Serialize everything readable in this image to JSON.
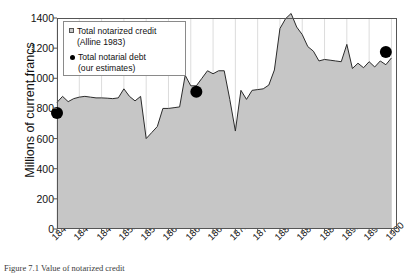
{
  "figure": {
    "caption": "Figure 7.1  Value of notarized credit"
  },
  "legend": {
    "items": [
      {
        "marker": "square-swatch",
        "line1": "Total notarized credit",
        "line2": "(Alline 1983)"
      },
      {
        "marker": "dot-swatch",
        "line1": "Total notarial debt",
        "line2": "(our estimates)"
      }
    ]
  },
  "chart_data": {
    "type": "area",
    "title": "",
    "xlabel": "",
    "ylabel": "Millions of current francs",
    "xlim": [
      1840,
      1901
    ],
    "ylim": [
      0,
      1400
    ],
    "yticks": [
      0,
      200,
      400,
      600,
      800,
      1000,
      1200,
      1400
    ],
    "xticks": [
      1840,
      1844,
      1848,
      1852,
      1856,
      1860,
      1864,
      1868,
      1872,
      1876,
      1880,
      1884,
      1888,
      1892,
      1896,
      1900
    ],
    "grid": true,
    "colors": {
      "area_fill": "#c6c6c6",
      "area_line": "#2b2b2b",
      "marker": "#000000",
      "axis": "#555555",
      "grid": "#dcdcdc"
    },
    "series": [
      {
        "name": "Total notarized credit (Alline 1983)",
        "type": "area",
        "x": [
          1840,
          1841,
          1842,
          1843,
          1844,
          1845,
          1846,
          1847,
          1848,
          1849,
          1850,
          1851,
          1852,
          1853,
          1854,
          1855,
          1856,
          1857,
          1858,
          1859,
          1860,
          1861,
          1862,
          1863,
          1864,
          1865,
          1866,
          1867,
          1868,
          1869,
          1870,
          1871,
          1872,
          1873,
          1874,
          1875,
          1876,
          1877,
          1878,
          1879,
          1880,
          1881,
          1882,
          1883,
          1884,
          1885,
          1886,
          1887,
          1888,
          1889,
          1890,
          1891,
          1892,
          1893,
          1894,
          1895,
          1896,
          1897,
          1898,
          1899,
          1900
        ],
        "values": [
          840,
          880,
          845,
          865,
          875,
          880,
          875,
          870,
          870,
          868,
          865,
          870,
          930,
          880,
          850,
          880,
          600,
          640,
          680,
          800,
          800,
          805,
          810,
          1020,
          950,
          950,
          1000,
          1050,
          1030,
          1050,
          1050,
          860,
          650,
          920,
          860,
          920,
          925,
          930,
          955,
          1055,
          1330,
          1395,
          1430,
          1340,
          1290,
          1210,
          1180,
          1115,
          1125,
          1120,
          1115,
          1110,
          1225,
          1065,
          1100,
          1070,
          1110,
          1075,
          1115,
          1090,
          1135
        ]
      },
      {
        "name": "Total notarial debt (our estimates)",
        "type": "scatter",
        "x": [
          1840,
          1865,
          1899
        ],
        "values": [
          770,
          910,
          1175
        ]
      }
    ]
  }
}
